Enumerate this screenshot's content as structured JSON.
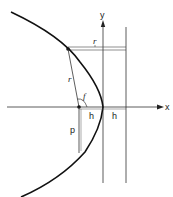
{
  "diagram": {
    "type": "parabola-geometry",
    "axes": {
      "x_label": "x",
      "y_label": "y"
    },
    "labels": {
      "r_top": "r",
      "r_slant": "r",
      "f": "f",
      "p": "p",
      "h_left": "h",
      "h_right": "h"
    },
    "colors": {
      "stroke": "#222222",
      "background": "#ffffff"
    }
  }
}
